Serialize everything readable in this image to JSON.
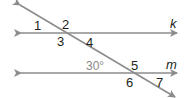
{
  "diagram": {
    "type": "parallel lines cut by a transversal",
    "lines": {
      "top": {
        "name": "k"
      },
      "bottom": {
        "name": "m"
      }
    },
    "angle_labels": [
      "1",
      "2",
      "3",
      "4",
      "5",
      "6",
      "7"
    ],
    "given_angle": "30°",
    "colors": {
      "line": "#8c8c8c",
      "text": "#231f20",
      "given_angle_text": "#8a8a8a"
    }
  }
}
